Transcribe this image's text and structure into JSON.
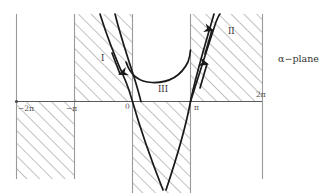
{
  "figure": {
    "kind": "complex-plane-diagram",
    "plane_label": "α−plane",
    "background": "#ffffff",
    "axis_color": "#5a5a5a",
    "hatch_color": "#8c8c8c",
    "curve_color": "#1a1a1a",
    "grid_line_color": "#9a9a9a"
  },
  "axis": {
    "y_px": 101,
    "x_start_px": 16,
    "x_end_px": 262,
    "tick_labels": [
      {
        "text": "−2π",
        "x": 18,
        "y": 105
      },
      {
        "text": "−π",
        "x": 66,
        "y": 105
      },
      {
        "text": "0",
        "x": 125,
        "y": 103
      },
      {
        "text": "π",
        "x": 194,
        "y": 104
      },
      {
        "text": "2π",
        "x": 256,
        "y": 91
      }
    ]
  },
  "bands": {
    "boundaries_px": [
      16,
      74,
      132,
      190,
      262
    ],
    "above_axis_hatched": [
      false,
      true,
      false,
      true
    ],
    "below_axis_hatched": [
      true,
      false,
      true,
      false
    ]
  },
  "regions": [
    {
      "id": "I",
      "text": "I",
      "x": 101,
      "y": 54
    },
    {
      "id": "II",
      "text": "II",
      "x": 228,
      "y": 27
    },
    {
      "id": "III",
      "text": "III",
      "x": 158,
      "y": 85
    }
  ],
  "curves": {
    "left_pair_descending": 2,
    "center_u_shape_min_y_px": 82,
    "right_pair_ascending": 2,
    "arrow_count": 3,
    "arrow_directions": [
      "down",
      "up",
      "up"
    ]
  }
}
